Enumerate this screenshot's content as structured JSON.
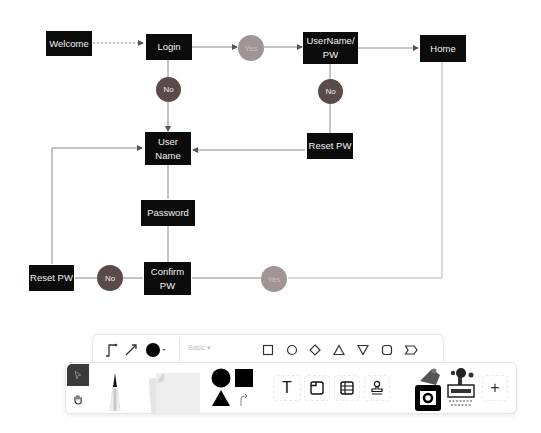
{
  "diagram": {
    "nodes": [
      {
        "id": "welcome",
        "label": "Welcome"
      },
      {
        "id": "login",
        "label": "Login"
      },
      {
        "id": "username_pw",
        "label": "UserName/ PW"
      },
      {
        "id": "home",
        "label": "Home"
      },
      {
        "id": "reset_pw_top",
        "label": "Reset PW"
      },
      {
        "id": "user_name",
        "label": "User Name"
      },
      {
        "id": "password",
        "label": "Password"
      },
      {
        "id": "confirm_pw",
        "label": "Confirm PW"
      },
      {
        "id": "reset_pw_bottom",
        "label": "Reset PW"
      }
    ],
    "decisions": [
      {
        "id": "yes_login",
        "label": "Yes"
      },
      {
        "id": "no_login",
        "label": "No"
      },
      {
        "id": "no_username_pw",
        "label": "No"
      },
      {
        "id": "no_confirm",
        "label": "No"
      },
      {
        "id": "yes_confirm",
        "label": "Yes"
      }
    ],
    "edges": [
      {
        "from": "welcome",
        "to": "login",
        "style": "dotted"
      },
      {
        "from": "login",
        "to": "yes_login"
      },
      {
        "from": "yes_login",
        "to": "username_pw"
      },
      {
        "from": "username_pw",
        "to": "home"
      },
      {
        "from": "login",
        "to": "no_login"
      },
      {
        "from": "no_login",
        "to": "user_name"
      },
      {
        "from": "username_pw",
        "to": "no_username_pw"
      },
      {
        "from": "no_username_pw",
        "to": "reset_pw_top"
      },
      {
        "from": "reset_pw_top",
        "to": "user_name"
      },
      {
        "from": "user_name",
        "to": "password"
      },
      {
        "from": "password",
        "to": "confirm_pw"
      },
      {
        "from": "confirm_pw",
        "to": "no_confirm"
      },
      {
        "from": "no_confirm",
        "to": "reset_pw_bottom"
      },
      {
        "from": "reset_pw_bottom",
        "to": "user_name"
      },
      {
        "from": "confirm_pw",
        "to": "yes_confirm"
      },
      {
        "from": "yes_confirm",
        "to": "home"
      }
    ],
    "colors": {
      "node_fill": "#0b0b0b",
      "node_text": "#f2f2f2",
      "no_fill": "#5a4a4a",
      "yes_fill": "#a09494",
      "edge": "#8a8a8a"
    }
  },
  "toolbar": {
    "sub": {
      "connector_tool": "elbow-connector-icon",
      "line_tool": "arrow-line-icon",
      "color_picker": "color-dot-icon",
      "style_select": "Basic",
      "shapes": [
        "rectangle",
        "circle",
        "diamond",
        "triangle",
        "inverted-triangle",
        "rounded-rectangle",
        "callout"
      ]
    },
    "main": {
      "select_tool": "pointer-icon",
      "hand_tool": "hand-icon",
      "pen_tool": "pen-icon",
      "sticky_notes": "sticky-notes-icon",
      "shapes_tool": "shapes-icon",
      "text_tool": "T",
      "frame_tool": "frame-icon",
      "table_tool": "table-icon",
      "stamp_tool": "stamp-icon",
      "camera_sticker": "camera-sticker-icon",
      "stamp_sticker": "stamp-sticker-icon",
      "add_button": "+"
    }
  }
}
